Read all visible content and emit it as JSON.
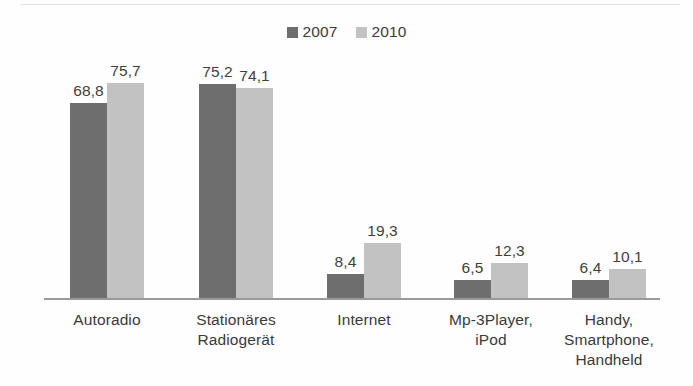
{
  "chart_data": {
    "type": "bar",
    "title": "",
    "subtitle": "",
    "xlabel": "",
    "ylabel": "",
    "ylim": [
      0,
      80
    ],
    "grid": false,
    "legend_position": "top-center",
    "value_label_format": "comma-decimal",
    "categories": [
      "Autoradio",
      "Stationäres\nRadiogerät",
      "Internet",
      "Mp-3Player,\niPod",
      "Handy,\nSmartphone,\nHandheld"
    ],
    "series": [
      {
        "name": "2007",
        "color": "#6e6e6e",
        "values": [
          68.8,
          75.2,
          8.4,
          6.5,
          6.4
        ],
        "labels": [
          "68,8",
          "75,2",
          "8,4",
          "6,5",
          "6,4"
        ]
      },
      {
        "name": "2010",
        "color": "#c2c2c2",
        "values": [
          75.7,
          74.1,
          19.3,
          12.3,
          10.1
        ],
        "labels": [
          "75,7",
          "74,1",
          "19,3",
          "12,3",
          "10,1"
        ]
      }
    ]
  },
  "legend": {
    "items": [
      {
        "label": "2007",
        "color": "#6e6e6e",
        "swatch_icon": "square-swatch-icon"
      },
      {
        "label": "2010",
        "color": "#c2c2c2",
        "swatch_icon": "square-swatch-icon"
      }
    ]
  },
  "axis": {
    "baseline_color": "#9a9a9a"
  }
}
